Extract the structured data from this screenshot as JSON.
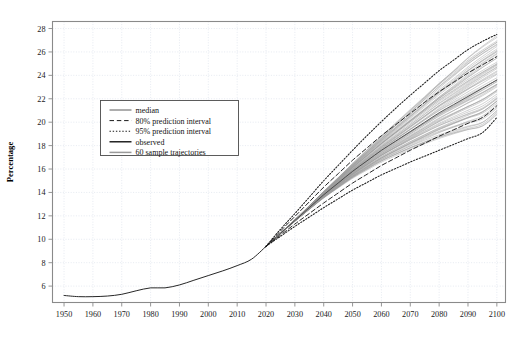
{
  "figure": {
    "top_partial_text": "",
    "ylabel": "Percentage",
    "xlabel": ""
  },
  "legend": {
    "entries": [
      {
        "label": "median",
        "style": "solid-thin",
        "color": "#333333"
      },
      {
        "label": "80% prediction interval",
        "style": "dashed",
        "color": "#1a1a1a"
      },
      {
        "label": "95% prediction interval",
        "style": "dotted",
        "color": "#1a1a1a"
      },
      {
        "label": "observed",
        "style": "solid-thick",
        "color": "#000000"
      },
      {
        "label": "60 sample trajectories",
        "style": "solid-gray",
        "color": "#9a9a9a"
      }
    ]
  },
  "colors": {
    "frame": "#8a8a8a",
    "grid": "#dfe4ee",
    "trajectory": "#9a9a9a",
    "median": "#3a3a3a",
    "observed": "#1a1a1a",
    "interval": "#1a1a1a",
    "background": "#ffffff",
    "tick_text": "#1a1a1a"
  },
  "chart_data": {
    "type": "line",
    "title": "",
    "xlabel": "",
    "ylabel": "Percentage",
    "xlim": [
      1946,
      2103
    ],
    "ylim": [
      4.6,
      28.6
    ],
    "grid": true,
    "legend_position": "upper-left-inside",
    "xticks": [
      1950,
      1960,
      1970,
      1980,
      1990,
      2000,
      2010,
      2020,
      2030,
      2040,
      2050,
      2060,
      2070,
      2080,
      2090,
      2100
    ],
    "yticks": [
      6,
      8,
      10,
      12,
      14,
      16,
      18,
      20,
      22,
      24,
      26,
      28
    ],
    "x": [
      1950,
      1955,
      1960,
      1965,
      1970,
      1975,
      1980,
      1985,
      1990,
      1995,
      2000,
      2005,
      2010,
      2015,
      2020,
      2025,
      2030,
      2035,
      2040,
      2045,
      2050,
      2055,
      2060,
      2065,
      2070,
      2075,
      2080,
      2085,
      2090,
      2095,
      2100
    ],
    "series": [
      {
        "name": "observed",
        "style": "solid-thick",
        "color": "#1a1a1a",
        "x": [
          1950,
          1955,
          1960,
          1965,
          1970,
          1975,
          1980,
          1985,
          1990,
          1995,
          2000,
          2005,
          2010,
          2015,
          2020
        ],
        "values": [
          5.2,
          5.1,
          5.1,
          5.15,
          5.3,
          5.6,
          5.85,
          5.85,
          6.1,
          6.5,
          6.9,
          7.3,
          7.75,
          8.3,
          9.4
        ]
      },
      {
        "name": "median",
        "style": "solid-thin",
        "color": "#3a3a3a",
        "x": [
          2020,
          2025,
          2030,
          2035,
          2040,
          2045,
          2050,
          2055,
          2060,
          2065,
          2070,
          2075,
          2080,
          2085,
          2090,
          2095,
          2100
        ],
        "values": [
          9.4,
          10.5,
          11.6,
          12.7,
          13.8,
          14.8,
          15.8,
          16.7,
          17.6,
          18.4,
          19.2,
          20.0,
          20.8,
          21.5,
          22.2,
          22.9,
          23.6
        ]
      },
      {
        "name": "80% prediction interval upper",
        "style": "dashed",
        "color": "#1a1a1a",
        "x": [
          2020,
          2025,
          2030,
          2035,
          2040,
          2045,
          2050,
          2055,
          2060,
          2065,
          2070,
          2075,
          2080,
          2085,
          2090,
          2095,
          2100
        ],
        "values": [
          9.4,
          10.7,
          11.95,
          13.2,
          14.45,
          15.6,
          16.75,
          17.8,
          18.85,
          19.8,
          20.75,
          21.7,
          22.6,
          23.4,
          24.2,
          24.9,
          25.6
        ]
      },
      {
        "name": "80% prediction interval lower",
        "style": "dashed",
        "color": "#1a1a1a",
        "x": [
          2020,
          2025,
          2030,
          2035,
          2040,
          2045,
          2050,
          2055,
          2060,
          2065,
          2070,
          2075,
          2080,
          2085,
          2090,
          2095,
          2100
        ],
        "values": [
          9.4,
          10.35,
          11.3,
          12.2,
          13.1,
          13.95,
          14.8,
          15.55,
          16.3,
          16.95,
          17.6,
          18.2,
          18.8,
          19.35,
          19.9,
          20.4,
          21.4
        ]
      },
      {
        "name": "95% prediction interval upper",
        "style": "dotted",
        "color": "#1a1a1a",
        "x": [
          2020,
          2025,
          2030,
          2035,
          2040,
          2045,
          2050,
          2055,
          2060,
          2065,
          2070,
          2075,
          2080,
          2085,
          2090,
          2095,
          2100
        ],
        "values": [
          9.4,
          10.85,
          12.2,
          13.6,
          15.0,
          16.3,
          17.6,
          18.85,
          20.05,
          21.2,
          22.3,
          23.35,
          24.4,
          25.3,
          26.2,
          26.9,
          27.5
        ]
      },
      {
        "name": "95% prediction interval lower",
        "style": "dotted",
        "color": "#1a1a1a",
        "x": [
          2020,
          2025,
          2030,
          2035,
          2040,
          2045,
          2050,
          2055,
          2060,
          2065,
          2070,
          2075,
          2080,
          2085,
          2090,
          2095,
          2100
        ],
        "values": [
          9.4,
          10.25,
          11.1,
          11.9,
          12.7,
          13.45,
          14.2,
          14.85,
          15.5,
          16.05,
          16.6,
          17.1,
          17.6,
          18.1,
          18.6,
          19.1,
          20.4
        ]
      }
    ],
    "trajectories_count": 60,
    "trajectory_end_range": [
      20.5,
      27.2
    ],
    "trajectory_color": "#9a9a9a",
    "fan_start_year": 2020
  }
}
